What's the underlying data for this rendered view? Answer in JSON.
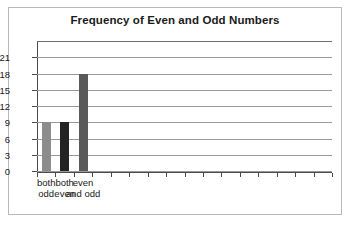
{
  "chart_data": {
    "type": "bar",
    "title": "Frequency of Even and Odd Numbers",
    "xlabel": "",
    "ylabel": "",
    "categories": [
      "both odd",
      "both even",
      "even and odd"
    ],
    "category_lines": [
      [
        "both",
        "odd"
      ],
      [
        "both",
        "even"
      ],
      [
        "even",
        "and odd"
      ]
    ],
    "values": [
      9,
      9,
      18
    ],
    "bar_colors": [
      "#8c8c8c",
      "#232323",
      "#5a5a5a"
    ],
    "ylim": [
      0,
      24
    ],
    "ytick_values": [
      0,
      3,
      6,
      9,
      12,
      15,
      18,
      21
    ],
    "ytick_labels": [
      "0",
      "3",
      "6",
      "9",
      "12",
      "15",
      "18",
      "21"
    ],
    "ytick_step": 3,
    "grid": true,
    "grid_orientation": "horizontal",
    "legend": "none",
    "x_tick_count": 16,
    "plot_background": "#ffffff",
    "grid_color": "#9a9a9a",
    "axis_color": "#4a4a4a",
    "frame_color": "#b8b8b8",
    "text_color": "#1a1a1a"
  }
}
